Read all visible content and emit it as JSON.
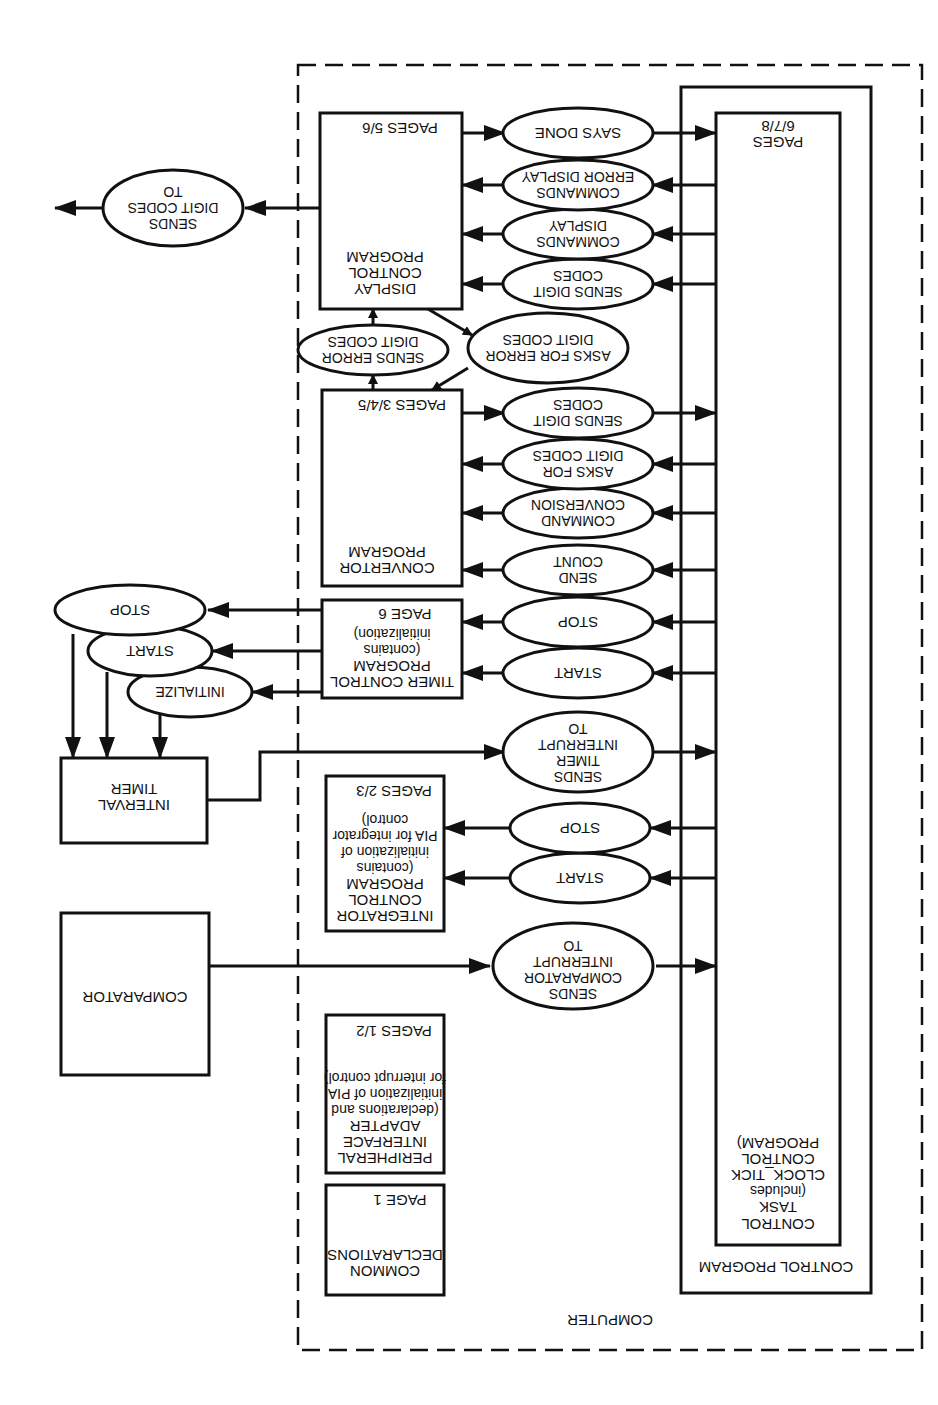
{
  "diagram": {
    "orientation": "rotated 180 degrees",
    "computer": {
      "label": "COMPUTER"
    },
    "control_program": {
      "label": "CONTROL PROGRAM",
      "task": {
        "line1": "CONTROL",
        "line2": "TASK",
        "line3": "(includes",
        "line4": "CLOCK_TICK",
        "line5": "CONTROL",
        "line6": "PROGRAM)",
        "pages_l1": "PAGES",
        "pages_l2": "6/7/8"
      }
    },
    "common_declarations": {
      "line1": "COMMON",
      "line2": "DECLARATIONS",
      "pages": "PAGE 1"
    },
    "pia": {
      "line1": "PERIPHERAL",
      "line2": "INTERFACE",
      "line3": "ADAPTER",
      "line4": "(declarations and",
      "line5": "initialization of PIA",
      "line6": "for interrupt control)",
      "pages": "PAGES 1/2"
    },
    "integrator": {
      "line1": "INTEGRATOR",
      "line2": "CONTROL",
      "line3": "PROGRAM",
      "line4": "(contains",
      "line5": "initialization of",
      "line6": "PIA for integrator",
      "line7": "control)",
      "pages": "PAGES 2/3"
    },
    "timer_control": {
      "line1": "TIMER CONTROL",
      "line2": "PROGRAM",
      "line3": "(contains",
      "line4": "initialization)",
      "pages": "PAGE 6"
    },
    "convertor": {
      "line1": "CONVERTOR",
      "line2": "PROGRAM",
      "pages": "PAGES 3/4/5"
    },
    "display_control": {
      "line1": "DISPLAY",
      "line2": "CONTROL",
      "line3": "PROGRAM",
      "pages": "PAGES 5/6"
    },
    "comparator": {
      "label": "COMPARATOR"
    },
    "interval_timer": {
      "line1": "INTERVAL",
      "line2": "TIMER"
    },
    "messages": {
      "sends_comparator_interrupt": {
        "l1": "SENDS",
        "l2": "COMPARATOR",
        "l3": "INTERRUPT",
        "l4": "TO"
      },
      "integrator_start": {
        "l1": "START"
      },
      "integrator_stop": {
        "l1": "STOP"
      },
      "sends_timer_interrupt": {
        "l1": "SENDS",
        "l2": "TIMER",
        "l3": "INTERRUPT",
        "l4": "TO"
      },
      "timer_start": {
        "l1": "START"
      },
      "timer_stop": {
        "l1": "STOP"
      },
      "send_count": {
        "l1": "SEND",
        "l2": "COUNT"
      },
      "command_conversion": {
        "l1": "COMMAND",
        "l2": "CONVERSION"
      },
      "asks_for_digit_codes": {
        "l1": "ASKS FOR",
        "l2": "DIGIT CODES"
      },
      "sends_digit_codes_conv": {
        "l1": "SENDS DIGIT",
        "l2": "CODES"
      },
      "asks_for_error_digit_codes": {
        "l1": "ASKS FOR ERROR",
        "l2": "DIGIT CODES"
      },
      "sends_error_digit_codes": {
        "l1": "SENDS ERROR",
        "l2": "DIGIT CODES"
      },
      "sends_digit_codes_disp": {
        "l1": "SENDS DIGIT",
        "l2": "CODES"
      },
      "commands_display": {
        "l1": "COMMANDS",
        "l2": "DISPLAY"
      },
      "commands_error_display": {
        "l1": "COMMANDS",
        "l2": "ERROR DISPLAY"
      },
      "says_done": {
        "l1": "SAYS DONE"
      },
      "hw_initialize": {
        "l1": "INITIALIZE"
      },
      "hw_start": {
        "l1": "START"
      },
      "hw_stop": {
        "l1": "STOP"
      },
      "sends_digit_codes_to": {
        "l1": "SENDS",
        "l2": "DIGIT CODES",
        "l3": "TO"
      }
    }
  }
}
